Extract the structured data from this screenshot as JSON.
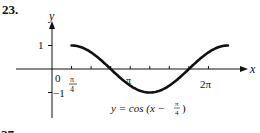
{
  "problem_number": "23.",
  "chart_data": {
    "type": "line",
    "title": "",
    "equation_label": "y = cos (x − π/4)",
    "xlabel": "x",
    "ylabel": "y",
    "function": "cos(x - pi/4)",
    "x_domain": [
      0.7854,
      7.0686
    ],
    "xlim": [
      0,
      7.5
    ],
    "ylim": [
      -1.4,
      1.9
    ],
    "x_ticks": [
      {
        "value": 0,
        "label": "0"
      },
      {
        "value": 0.7854,
        "label": "π/4"
      },
      {
        "value": 1.5708,
        "label": ""
      },
      {
        "value": 2.3562,
        "label": ""
      },
      {
        "value": 3.1416,
        "label": "π"
      },
      {
        "value": 3.927,
        "label": ""
      },
      {
        "value": 4.7124,
        "label": ""
      },
      {
        "value": 5.4978,
        "label": ""
      },
      {
        "value": 6.2832,
        "label": "2π"
      }
    ],
    "y_ticks": [
      {
        "value": 1,
        "label": "1"
      },
      {
        "value": -1,
        "label": "−1"
      }
    ],
    "series": [
      {
        "name": "y = cos(x − π/4)",
        "x": [
          0.7854,
          1.5708,
          2.3562,
          3.1416,
          3.927,
          4.7124,
          5.4978,
          6.2832,
          7.0686
        ],
        "y": [
          1,
          0.7071,
          0,
          -0.7071,
          -1,
          -0.7071,
          0,
          0.7071,
          1
        ]
      }
    ],
    "grid": false,
    "legend": "none",
    "colors": {
      "axis": "#111111",
      "curve": "#111111"
    }
  },
  "labels": {
    "zero": "0",
    "pi_over_4_num": "π",
    "pi_over_4_den": "4",
    "pi": "π",
    "two_pi": "2π",
    "one": "1",
    "neg_one": "−1",
    "x_axis": "x",
    "y_axis": "y",
    "eq_prefix": "y = cos (x − ",
    "eq_frac_num": "π",
    "eq_frac_den": "4",
    "eq_suffix": ")",
    "next_problem": "27"
  }
}
